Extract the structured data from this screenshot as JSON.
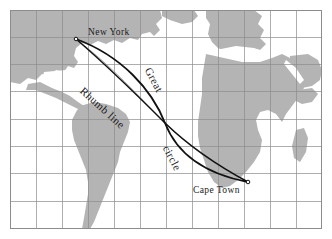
{
  "figure": {
    "background": "#ffffff"
  },
  "map": {
    "frame": {
      "border_color": "#9a9a9a",
      "ocean_color": "#ffffff"
    },
    "graticule": {
      "color": "#8c8c8c",
      "columns": 12,
      "rows": 8,
      "visible": true
    },
    "land_color": "#b4b4b4",
    "landmasses": [
      "north-america",
      "central-america",
      "south-america",
      "greenland",
      "europe",
      "africa",
      "arabia",
      "madagascar"
    ]
  },
  "route": {
    "endpoints": [
      {
        "id": "new-york",
        "label": "New York",
        "x": 76,
        "y": 39
      },
      {
        "id": "cape-town",
        "label": "Cape Town",
        "x": 248,
        "y": 182
      }
    ],
    "lines": [
      {
        "id": "rhumb-line",
        "label": "Rhumb line",
        "style": "straight",
        "color": "#000000"
      },
      {
        "id": "great-circle",
        "label_part_1": "Great",
        "label_part_2": "circle",
        "style": "curved",
        "color": "#000000"
      },
      {
        "id": "thin-guide",
        "style": "thin",
        "color": "#808080"
      }
    ]
  },
  "labels": {
    "new_york": "New York",
    "cape_town": "Cape Town",
    "rhumb_line": "Rhumb line",
    "great": "Great",
    "circle": "circle"
  }
}
